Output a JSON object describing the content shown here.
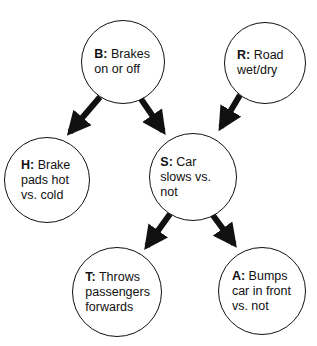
{
  "diagram": {
    "type": "causal-graph",
    "nodes": [
      {
        "id": "B",
        "key": "B:",
        "text": "Brakes on or off",
        "cx": 123,
        "cy": 62,
        "r": 42
      },
      {
        "id": "R",
        "key": "R:",
        "text": "Road wet/dry",
        "cx": 265,
        "cy": 63,
        "r": 41
      },
      {
        "id": "H",
        "key": "H:",
        "text": "Brake pads hot vs. cold",
        "cx": 47,
        "cy": 180,
        "r": 43
      },
      {
        "id": "S",
        "key": "S:",
        "text": "Car slows vs. not",
        "cx": 193,
        "cy": 177,
        "r": 44
      },
      {
        "id": "T",
        "key": "T:",
        "text": "Throws passengers forwards",
        "cx": 117,
        "cy": 292,
        "r": 45
      },
      {
        "id": "A",
        "key": "A:",
        "text": "Bumps car in front vs. not",
        "cx": 262,
        "cy": 291,
        "r": 44
      }
    ],
    "edges": [
      {
        "from": "B",
        "to": "H"
      },
      {
        "from": "B",
        "to": "S"
      },
      {
        "from": "R",
        "to": "S"
      },
      {
        "from": "S",
        "to": "T"
      },
      {
        "from": "S",
        "to": "A"
      }
    ],
    "colors": {
      "stroke": "#111111",
      "fill": "#ffffff"
    }
  }
}
